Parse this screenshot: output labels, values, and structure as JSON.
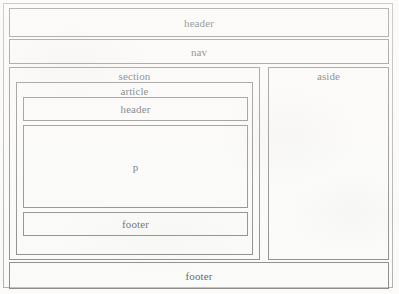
{
  "diagram": {
    "style": {
      "page_background": "#fdfdfc",
      "box_border_color": "#555555",
      "frame_border_color": "#8d8d8d",
      "text_color": "#111111"
    },
    "blocks": {
      "header": {
        "label": "header"
      },
      "nav": {
        "label": "nav"
      },
      "section": {
        "label": "section"
      },
      "article": {
        "label": "article"
      },
      "article_header": {
        "label": "header"
      },
      "paragraph": {
        "label": "p"
      },
      "article_footer": {
        "label": "footer"
      },
      "aside": {
        "label": "aside"
      },
      "footer": {
        "label": "footer"
      }
    }
  }
}
